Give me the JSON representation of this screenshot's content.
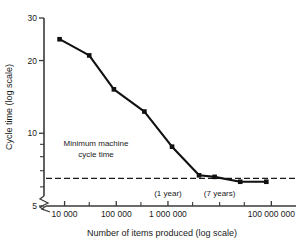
{
  "chart_data": {
    "type": "line",
    "title": "",
    "xlabel": "Number of items produced (log scale)",
    "ylabel": "Cycle time (log scale)",
    "xscale": "log",
    "yscale": "log",
    "xlim": [
      4000,
      300000000
    ],
    "ylim": [
      5,
      30
    ],
    "grid": false,
    "legend": "none",
    "x": [
      8000,
      30000,
      90000,
      350000,
      1200000,
      4000000,
      8000000,
      25000000,
      80000000
    ],
    "values": [
      24.5,
      21.0,
      15.2,
      12.3,
      8.8,
      6.7,
      6.6,
      6.3,
      6.3
    ],
    "series": [
      {
        "name": "Cycle time",
        "marker": "square",
        "color": "#111111",
        "values": [
          24.5,
          21.0,
          15.2,
          12.3,
          8.8,
          6.7,
          6.6,
          6.3,
          6.3
        ]
      }
    ],
    "xticks": [
      10000,
      100000,
      1000000,
      100000000
    ],
    "xtick_labels": [
      "10 000",
      "100 000",
      "1 000 000",
      "100 000 000"
    ],
    "xminor_ticks": [
      30000,
      300000,
      3000000,
      10000000,
      30000000
    ],
    "yticks": [
      30,
      20,
      10,
      5
    ],
    "ytick_labels": [
      "30",
      "20",
      "10",
      "5"
    ],
    "yminor_ticks": [
      9,
      8,
      7,
      6
    ],
    "reference_line": {
      "label_line1": "Minimum machine",
      "label_line2": "cycle time",
      "value": 6.5,
      "style": "dashed",
      "color": "#1a1a1a"
    },
    "annotations": [
      {
        "text": "(1 year)",
        "x": 1000000
      },
      {
        "text": "(7 years)",
        "x": 10000000
      }
    ],
    "axis_break": "zigzag-at-origin"
  },
  "axes": {
    "x_title": "Number of items produced (log scale)",
    "y_title": "Cycle time (log scale)"
  }
}
